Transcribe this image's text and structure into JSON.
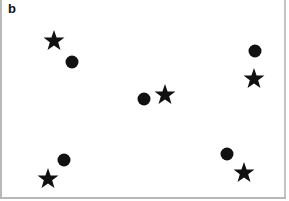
{
  "panel": {
    "label": "b"
  },
  "colors": {
    "marker": "#111111",
    "frame": "#b8b8b8",
    "background": "#ffffff"
  },
  "markers": [
    {
      "shape": "star",
      "x": 54,
      "y": 41
    },
    {
      "shape": "circle",
      "x": 72,
      "y": 62
    },
    {
      "shape": "circle",
      "x": 255,
      "y": 51
    },
    {
      "shape": "star",
      "x": 254,
      "y": 79
    },
    {
      "shape": "circle",
      "x": 144,
      "y": 99
    },
    {
      "shape": "star",
      "x": 165,
      "y": 95
    },
    {
      "shape": "circle",
      "x": 64,
      "y": 160
    },
    {
      "shape": "star",
      "x": 48,
      "y": 179
    },
    {
      "shape": "circle",
      "x": 227,
      "y": 154
    },
    {
      "shape": "star",
      "x": 244,
      "y": 173
    }
  ]
}
